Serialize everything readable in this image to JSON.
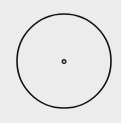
{
  "diagram": {
    "type": "circle",
    "center_label": "o",
    "stroke_color": "#111111",
    "background": "#ececec",
    "circle": {
      "cx": 64,
      "cy": 61,
      "r": 47
    }
  }
}
